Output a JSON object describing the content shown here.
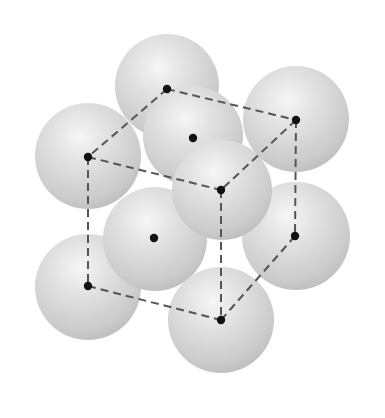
{
  "diagram": {
    "type": "crystal-unit-cell",
    "colors": {
      "background": "#ffffff",
      "sphere_light": "#f4f4f4",
      "sphere_mid": "#d8d8d8",
      "sphere_dark": "#b9b9b9",
      "edge": "#555555",
      "point": "#111111"
    },
    "spheres": [
      {
        "id": "top-back",
        "cx": 167,
        "cy": 86,
        "r": 52
      },
      {
        "id": "top-back-right",
        "cx": 296,
        "cy": 119,
        "r": 53
      },
      {
        "id": "top-front-left",
        "cx": 88,
        "cy": 156,
        "r": 53
      },
      {
        "id": "top-face-center",
        "cx": 193,
        "cy": 136,
        "r": 50
      },
      {
        "id": "bottom-back-right",
        "cx": 296,
        "cy": 236,
        "r": 54
      },
      {
        "id": "bottom-front-left",
        "cx": 88,
        "cy": 287,
        "r": 53
      },
      {
        "id": "left-face-center",
        "cx": 155,
        "cy": 239,
        "r": 52
      },
      {
        "id": "top-front-right",
        "cx": 222,
        "cy": 190,
        "r": 50
      },
      {
        "id": "bottom-front-right",
        "cx": 221,
        "cy": 320,
        "r": 53
      }
    ],
    "points": [
      {
        "id": "corner-top-back-left",
        "x": 167,
        "y": 89
      },
      {
        "id": "corner-top-back-right",
        "x": 296,
        "y": 120
      },
      {
        "id": "corner-top-front-left",
        "x": 88,
        "y": 157
      },
      {
        "id": "corner-top-front-right",
        "x": 221,
        "y": 190
      },
      {
        "id": "corner-bottom-front-left",
        "x": 88,
        "y": 286
      },
      {
        "id": "corner-bottom-front-right",
        "x": 221,
        "y": 320
      },
      {
        "id": "corner-bottom-back-right",
        "x": 295,
        "y": 236
      },
      {
        "id": "face-center-top",
        "x": 193,
        "y": 138
      },
      {
        "id": "face-center-left",
        "x": 154,
        "y": 238
      }
    ],
    "edges": [
      {
        "id": "edge-top-back",
        "x1": 167,
        "y1": 89,
        "x2": 296,
        "y2": 120
      },
      {
        "id": "edge-top-left",
        "x1": 167,
        "y1": 89,
        "x2": 88,
        "y2": 157
      },
      {
        "id": "edge-top-front",
        "x1": 88,
        "y1": 157,
        "x2": 221,
        "y2": 190
      },
      {
        "id": "edge-top-right",
        "x1": 296,
        "y1": 120,
        "x2": 221,
        "y2": 190
      },
      {
        "id": "edge-front-left-vertical",
        "x1": 88,
        "y1": 157,
        "x2": 88,
        "y2": 286
      },
      {
        "id": "edge-front-right-vertical",
        "x1": 221,
        "y1": 190,
        "x2": 221,
        "y2": 320
      },
      {
        "id": "edge-back-right-vertical",
        "x1": 296,
        "y1": 120,
        "x2": 295,
        "y2": 236
      },
      {
        "id": "edge-bottom-front",
        "x1": 88,
        "y1": 286,
        "x2": 221,
        "y2": 320
      },
      {
        "id": "edge-bottom-right",
        "x1": 295,
        "y1": 236,
        "x2": 221,
        "y2": 320
      }
    ]
  }
}
